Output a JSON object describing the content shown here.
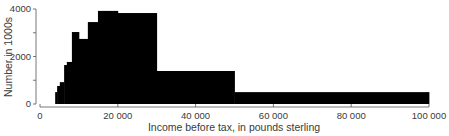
{
  "chart_data": {
    "type": "bar",
    "subtype": "histogram",
    "title": "",
    "xlabel": "Income before tax, in pounds sterling",
    "ylabel": "Number in 1000s",
    "xlim": [
      0,
      100000
    ],
    "ylim": [
      0,
      4000
    ],
    "x_ticks": [
      0,
      20000,
      40000,
      60000,
      80000,
      100000
    ],
    "x_tick_labels": [
      "0",
      "20 000",
      "40 000",
      "60 000",
      "80 000",
      "100 000"
    ],
    "y_ticks": [
      0,
      1000,
      2000,
      3000,
      4000
    ],
    "y_tick_labels": [
      "0",
      "",
      "2000",
      "",
      "4000"
    ],
    "grid": false,
    "legend": null,
    "bins": [
      {
        "from": 3900,
        "to": 4400,
        "value": 500
      },
      {
        "from": 4400,
        "to": 5100,
        "value": 760
      },
      {
        "from": 5100,
        "to": 6200,
        "value": 920
      },
      {
        "from": 6200,
        "to": 6900,
        "value": 1640
      },
      {
        "from": 6900,
        "to": 8200,
        "value": 1770
      },
      {
        "from": 8200,
        "to": 10000,
        "value": 3030
      },
      {
        "from": 10000,
        "to": 12300,
        "value": 2740
      },
      {
        "from": 12300,
        "to": 14900,
        "value": 3450
      },
      {
        "from": 14900,
        "to": 20000,
        "value": 3920
      },
      {
        "from": 20000,
        "to": 30000,
        "value": 3830
      },
      {
        "from": 30000,
        "to": 50000,
        "value": 1390
      },
      {
        "from": 50000,
        "to": 100000,
        "value": 500
      }
    ],
    "bar_color": "#000000"
  }
}
